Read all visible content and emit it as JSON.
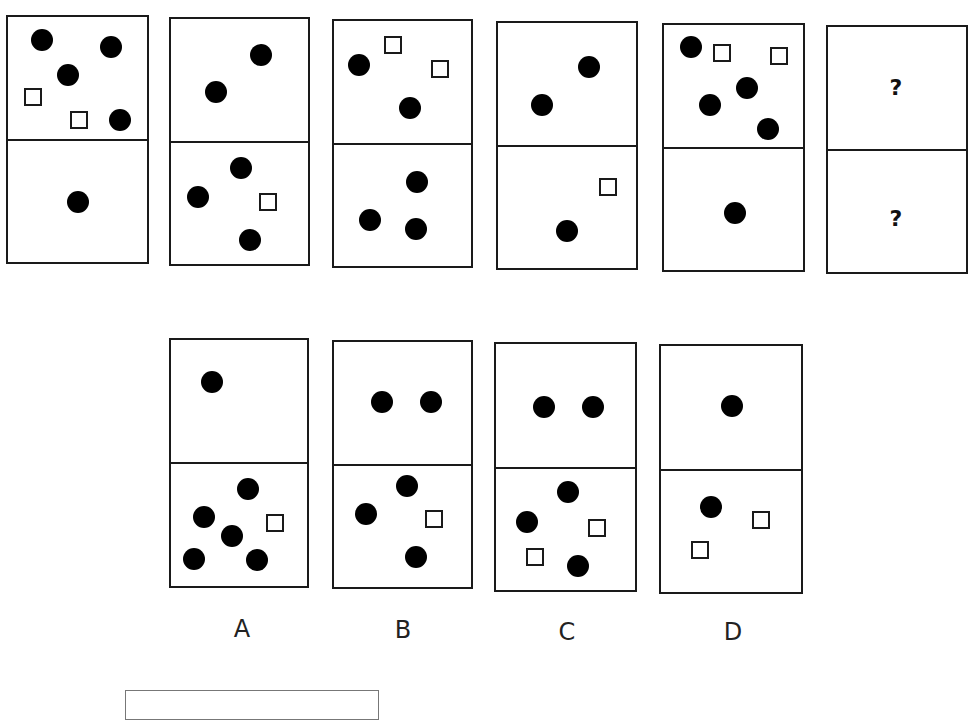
{
  "puzzle": {
    "sequence": [
      {
        "id": 1,
        "top": {
          "circles": 4,
          "squares": 2
        },
        "bottom": {
          "circles": 1,
          "squares": 0
        }
      },
      {
        "id": 2,
        "top": {
          "circles": 2,
          "squares": 0
        },
        "bottom": {
          "circles": 3,
          "squares": 1
        }
      },
      {
        "id": 3,
        "top": {
          "circles": 2,
          "squares": 2
        },
        "bottom": {
          "circles": 3,
          "squares": 0
        }
      },
      {
        "id": 4,
        "top": {
          "circles": 2,
          "squares": 0
        },
        "bottom": {
          "circles": 1,
          "squares": 1
        }
      },
      {
        "id": 5,
        "top": {
          "circles": 4,
          "squares": 2
        },
        "bottom": {
          "circles": 1,
          "squares": 0
        }
      },
      {
        "id": 6,
        "top": {
          "text": "?"
        },
        "bottom": {
          "text": "?"
        }
      }
    ],
    "options": [
      {
        "label": "A",
        "top": {
          "circles": 1,
          "squares": 0
        },
        "bottom": {
          "circles": 5,
          "squares": 1
        }
      },
      {
        "label": "B",
        "top": {
          "circles": 2,
          "squares": 0
        },
        "bottom": {
          "circles": 3,
          "squares": 1
        }
      },
      {
        "label": "C",
        "top": {
          "circles": 2,
          "squares": 0
        },
        "bottom": {
          "circles": 3,
          "squares": 2
        }
      },
      {
        "label": "D",
        "top": {
          "circles": 1,
          "squares": 0
        },
        "bottom": {
          "circles": 1,
          "squares": 2
        }
      }
    ],
    "question_mark_top": "?",
    "question_mark_bottom": "?",
    "option_labels": [
      "A",
      "B",
      "C",
      "D"
    ]
  }
}
